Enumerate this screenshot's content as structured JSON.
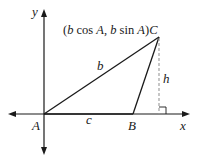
{
  "diagram": {
    "type": "triangle-on-coordinate-axes",
    "axes": {
      "x_label": "x",
      "y_label": "y"
    },
    "vertices": {
      "A": {
        "label": "A",
        "description": "origin"
      },
      "B": {
        "label": "B",
        "description": "on positive x-axis"
      },
      "C": {
        "label": "C",
        "coords_label": "(b cos A, b sin A)"
      }
    },
    "sides": {
      "b": "b",
      "c": "c"
    },
    "height": {
      "label": "h",
      "style": "dashed",
      "right_angle_marker": true
    },
    "colors": {
      "line": "#1a1a1a",
      "dashed": "#999999",
      "background": "#ffffff"
    }
  }
}
